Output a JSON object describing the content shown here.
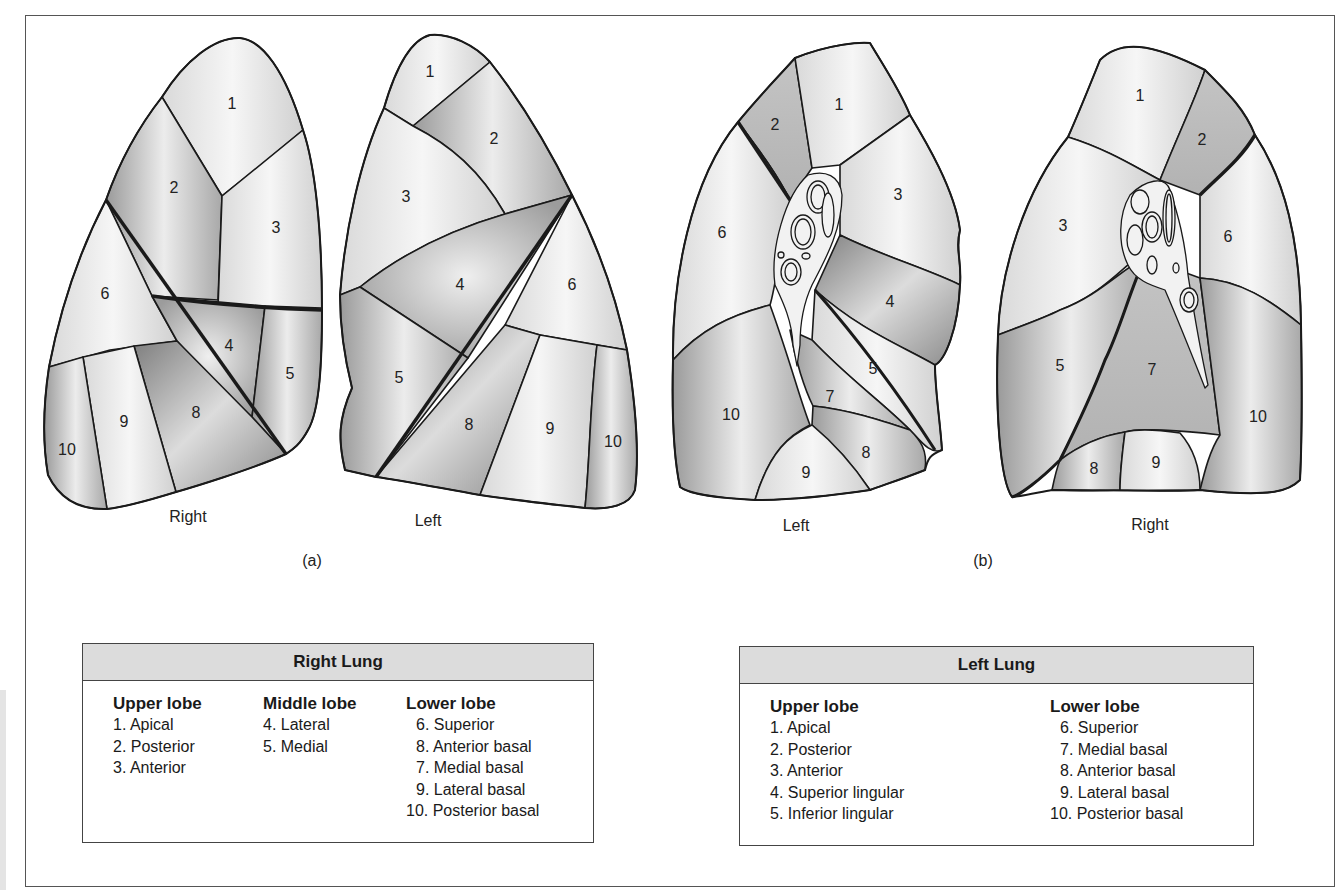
{
  "figure": {
    "panels": [
      {
        "id": "a",
        "label": "(a)",
        "views": [
          {
            "name": "Right",
            "label": "Right",
            "segments": [
              "1",
              "2",
              "3",
              "4",
              "5",
              "6",
              "8",
              "9",
              "10"
            ]
          },
          {
            "name": "Left",
            "label": "Left",
            "segments": [
              "1",
              "2",
              "3",
              "4",
              "5",
              "6",
              "8",
              "9",
              "10"
            ]
          }
        ]
      },
      {
        "id": "b",
        "label": "(b)",
        "views": [
          {
            "name": "Left",
            "label": "Left",
            "segments": [
              "1",
              "2",
              "3",
              "4",
              "5",
              "6",
              "7",
              "8",
              "9",
              "10"
            ]
          },
          {
            "name": "Right",
            "label": "Right",
            "segments": [
              "1",
              "2",
              "3",
              "5",
              "6",
              "7",
              "8",
              "9",
              "10"
            ]
          }
        ]
      }
    ],
    "colors": {
      "outline": "#1a1a1a",
      "legend_header_bg": "#dcdcdc",
      "frame": "#555555"
    }
  },
  "legends": {
    "right_lung": {
      "title": "Right Lung",
      "columns": [
        {
          "title": "Upper lobe",
          "items": [
            "1. Apical",
            "2. Posterior",
            "3. Anterior"
          ]
        },
        {
          "title": "Middle lobe",
          "items": [
            "4. Lateral",
            "5. Medial"
          ]
        },
        {
          "title": "Lower lobe",
          "items": [
            "6. Superior",
            "8. Anterior basal",
            "7. Medial basal",
            "9. Lateral basal",
            "10. Posterior basal"
          ]
        }
      ]
    },
    "left_lung": {
      "title": "Left Lung",
      "columns": [
        {
          "title": "Upper lobe",
          "items": [
            "1. Apical",
            "2. Posterior",
            "3. Anterior",
            "4. Superior lingular",
            "5. Inferior lingular"
          ]
        },
        {
          "title": "Lower lobe",
          "items": [
            "6. Superior",
            "7. Medial basal",
            "8. Anterior basal",
            "9. Lateral basal",
            "10. Posterior basal"
          ]
        }
      ]
    }
  }
}
